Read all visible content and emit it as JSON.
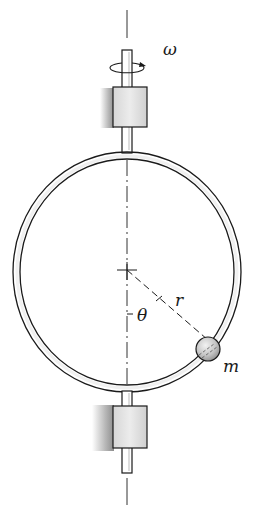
{
  "figure": {
    "labels": {
      "omega": "ω",
      "r": "r",
      "theta": "θ",
      "mass": "m"
    },
    "colors": {
      "ink": "#1a1a1a",
      "ring_fill": "#f4f4f4",
      "bearing_fill": "#e2e2e2",
      "wall_shade": "#9a9a9a",
      "ball_fill": "#c8c8c8"
    },
    "components": [
      "vertical rotation axis (dash-dot)",
      "upper shaft with rotation arrow",
      "upper bearing with wall support",
      "circular hoop",
      "lower bearing with wall support",
      "lower shaft",
      "bead of mass m on hoop",
      "radius line r at angle theta from vertical"
    ]
  }
}
